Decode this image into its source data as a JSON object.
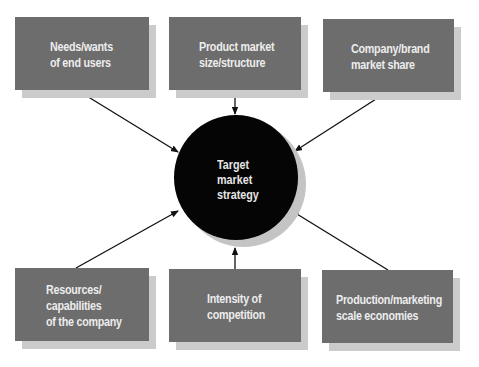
{
  "diagram": {
    "center": {
      "label": "Target\nmarket\nstrategy"
    },
    "factors": [
      {
        "id": "needs",
        "label": "Needs/wants\nof end users",
        "position": "top-left"
      },
      {
        "id": "product-market",
        "label": "Product market\nsize/structure",
        "position": "top-center"
      },
      {
        "id": "company-share",
        "label": "Company/brand\nmarket share",
        "position": "top-right"
      },
      {
        "id": "resources",
        "label": "Resources/\ncapabilities\nof the company",
        "position": "bottom-left"
      },
      {
        "id": "competition",
        "label": "Intensity of\ncompetition",
        "position": "bottom-center"
      },
      {
        "id": "scale",
        "label": "Production/marketing\nscale economies",
        "position": "bottom-right"
      }
    ],
    "arrows": [
      {
        "from": "needs",
        "to": "center"
      },
      {
        "from": "product-market",
        "to": "center"
      },
      {
        "from": "company-share",
        "to": "center"
      },
      {
        "from": "resources",
        "to": "center"
      },
      {
        "from": "competition",
        "to": "center"
      },
      {
        "from": "scale",
        "to": "center"
      }
    ],
    "colors": {
      "box": "#6d6d6d",
      "box_shadow": "#cbcbcb",
      "box_text": "#ececec",
      "circle": "#050505",
      "arrow": "#111111"
    }
  }
}
